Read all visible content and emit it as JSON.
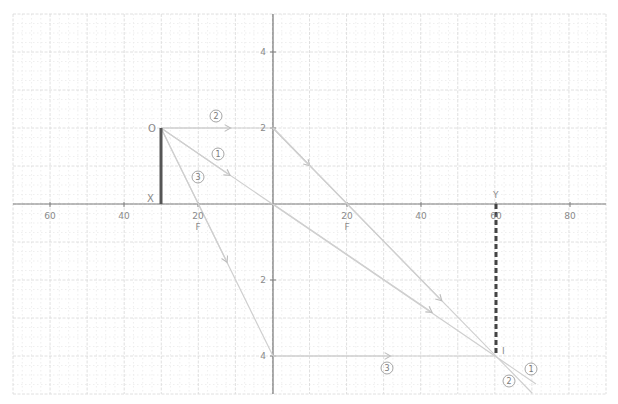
{
  "diagram": {
    "type": "ray-diagram-converging-lens",
    "colors": {
      "major_grid": "#d6d6d6",
      "minor_grid": "#e6e6e6",
      "axis": "#7a7a7a",
      "ray": "#cfcfcf",
      "object": "#555555",
      "image": "#444444",
      "label": "#8a8a8a"
    },
    "x_tick_labels": [
      {
        "text": "60",
        "x": 50
      },
      {
        "text": "40",
        "x": 124
      },
      {
        "text": "20",
        "x": 198
      },
      {
        "text": "20",
        "x": 347
      },
      {
        "text": "40",
        "x": 421
      },
      {
        "text": "60",
        "x": 496
      },
      {
        "text": "80",
        "x": 570
      }
    ],
    "y_tick_labels": [
      {
        "text": "4",
        "y": 52
      },
      {
        "text": "2",
        "y": 128
      },
      {
        "text": "2",
        "y": 280
      },
      {
        "text": "4",
        "y": 356
      }
    ],
    "focal_labels": [
      {
        "text": "F",
        "x": 198
      },
      {
        "text": "F",
        "x": 347
      }
    ],
    "points": {
      "object_top": "O",
      "object_base": "X",
      "image_base": "Y",
      "image_tip": "I"
    },
    "ray_labels": [
      {
        "text": "1",
        "x": 218,
        "y": 154
      },
      {
        "text": "2",
        "x": 216,
        "y": 116
      },
      {
        "text": "3",
        "x": 198,
        "y": 177
      },
      {
        "text": "3",
        "x": 387,
        "y": 368
      },
      {
        "text": "1",
        "x": 531,
        "y": 369
      },
      {
        "text": "2",
        "x": 509,
        "y": 381
      }
    ]
  }
}
